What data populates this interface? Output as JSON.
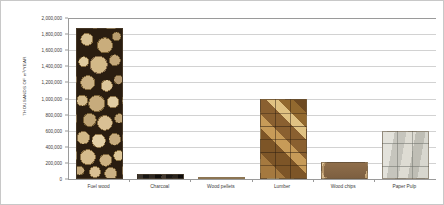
{
  "chart_data": {
    "type": "bar",
    "title": "",
    "subtitle": "",
    "xlabel": "",
    "ylabel": "THOUSANDS OF m³/YEAR",
    "categories": [
      "Fuel wood",
      "Charcoal",
      "Wood pellets",
      "Lumber",
      "Wood chips",
      "Paper Pulp"
    ],
    "values": [
      1880000,
      60000,
      25000,
      1000000,
      210000,
      600000
    ],
    "ylim": [
      0,
      2000000
    ],
    "ytick_values": [
      0,
      200000,
      400000,
      600000,
      800000,
      1000000,
      1200000,
      1400000,
      1600000,
      1800000,
      2000000
    ],
    "ytick_labels": [
      "0",
      "200,000",
      "400,000",
      "600,000",
      "800,000",
      "1,000,000",
      "1,200,000",
      "1,400,000",
      "1,600,000",
      "1,800,000",
      "2,000,000"
    ],
    "grid": true,
    "legend": false,
    "legend_position": "none",
    "bar_textures": [
      "fuelwood",
      "charcoal",
      "pellets",
      "lumber",
      "chips",
      "pulp"
    ],
    "colors": {
      "background": "#ffffff",
      "axis": "#9a9a9a",
      "gridline": "#d2d2d2",
      "text": "#3c3c3c",
      "border": "#c8c8c8",
      "fuelwood": "#8a6f43",
      "charcoal": "#1b1815",
      "pellets": "#c9a977",
      "lumber": "#8a6236",
      "chips": "#8a6a49",
      "pulp": "#d3d2cb"
    }
  }
}
